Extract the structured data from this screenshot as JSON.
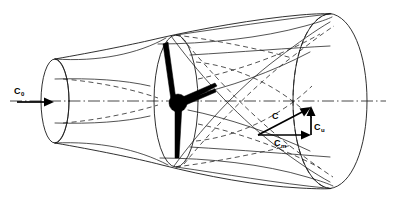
{
  "diagram": {
    "background_color": "#ffffff",
    "line_color": "#1a1a1a",
    "accent_color": "#000000",
    "width": 394,
    "height": 202
  },
  "labels": {
    "inlet_velocity": {
      "symbol": "C",
      "subscript": "0",
      "full": "C0",
      "meaning": "inlet absolute velocity"
    },
    "absolute_velocity": {
      "symbol": "C",
      "subscript": "",
      "full": "C",
      "meaning": "outlet absolute velocity"
    },
    "meridional_velocity": {
      "symbol": "C",
      "subscript": "m",
      "full": "Cm",
      "meaning": "meridional velocity component"
    },
    "tangential_velocity": {
      "symbol": "C",
      "subscript": "u",
      "full": "Cu",
      "meaning": "tangential velocity component"
    }
  },
  "components": {
    "inlet_duct": "small cylindrical inlet section at left",
    "throat": "converging waist between inlet and impeller plane",
    "impeller": "central hub with radiating blades",
    "outlet_duct": "large cylindrical outlet section at right",
    "streamlines": "helical flow paths through passage",
    "axis": "dash-dot machine centerline"
  },
  "geometry": {
    "inlet_ellipse": {
      "cx": 55,
      "cy": 101,
      "rx": 14,
      "ry": 42
    },
    "impeller_ellipse": {
      "cx": 176,
      "cy": 101,
      "rx": 22,
      "ry": 66
    },
    "outlet_ellipse": {
      "cx": 330,
      "cy": 101,
      "rx": 37,
      "ry": 88
    },
    "hub": {
      "cx": 178,
      "cy": 103,
      "r": 9
    },
    "axis_y": 101
  },
  "vectors": {
    "inlet_arrow": {
      "x1": 17,
      "y1": 102,
      "x2": 52,
      "y2": 102
    },
    "absolute": {
      "x1": 258,
      "y1": 135,
      "x2": 311,
      "y2": 107
    },
    "meridional": {
      "x1": 258,
      "y1": 135,
      "x2": 311,
      "y2": 135
    },
    "tangential": {
      "x1": 311,
      "y1": 135,
      "x2": 311,
      "y2": 107
    }
  }
}
